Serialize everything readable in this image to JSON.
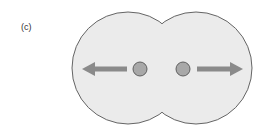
{
  "figure": {
    "panel_label": "(c)",
    "colors": {
      "background": "#ffffff",
      "body_fill": "#ebebeb",
      "body_outline": "#555555",
      "dot_fill": "#a8a8a8",
      "dot_outline": "#555555",
      "arrow": "#8a8a8a"
    },
    "elements": {
      "left_lobe": {
        "cx": 128,
        "cy": 68,
        "r": 56
      },
      "right_lobe": {
        "cx": 196,
        "cy": 68,
        "r": 56
      },
      "left_dot": {
        "cx": 140,
        "cy": 69,
        "r": 7
      },
      "right_dot": {
        "cx": 183,
        "cy": 69,
        "r": 7
      },
      "left_arrow": {
        "direction": "left"
      },
      "right_arrow": {
        "direction": "right"
      }
    }
  }
}
